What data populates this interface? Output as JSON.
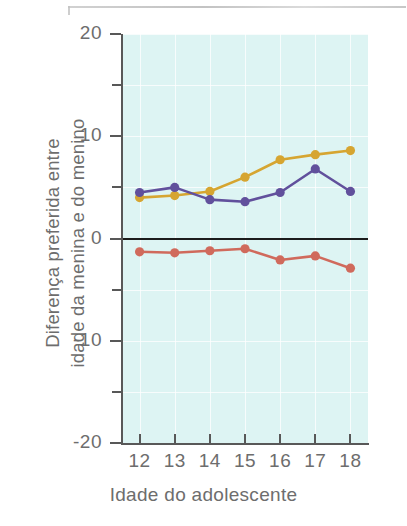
{
  "chart_data": {
    "type": "line",
    "title": "",
    "subtitle": "",
    "xlabel": "Idade do adolescente",
    "ylabel": "Diferença preferida entre idade da menina e do menino",
    "ylabel_line1": "Diferença preferida entre",
    "ylabel_line2": "idade da menina e do menino",
    "x": [
      12,
      13,
      14,
      15,
      16,
      17,
      18
    ],
    "categories": [
      "12",
      "13",
      "14",
      "15",
      "16",
      "17",
      "18"
    ],
    "xlim": [
      11.5,
      18.5
    ],
    "ylim": [
      -20,
      20
    ],
    "ytick_labels": [
      "20",
      "10",
      "0",
      "-10",
      "-20"
    ],
    "ytick_values": [
      20,
      10,
      0,
      -10,
      -20
    ],
    "yminor_values": [
      15,
      5,
      -5,
      -15
    ],
    "grid": true,
    "legend": "none",
    "plot_background": "#ddf4f3",
    "zero_line_color": "#1c1c1c",
    "series": [
      {
        "name": "serie-amarela",
        "color": "#d6a531",
        "marker": "circle",
        "values": [
          4.0,
          4.2,
          4.6,
          6.0,
          7.7,
          8.2,
          8.6
        ]
      },
      {
        "name": "serie-roxa",
        "color": "#61509c",
        "marker": "circle",
        "values": [
          4.5,
          5.0,
          3.8,
          3.6,
          4.5,
          6.8,
          4.6
        ]
      },
      {
        "name": "serie-vermelha",
        "color": "#d06a5c",
        "marker": "circle",
        "values": [
          -1.3,
          -1.4,
          -1.2,
          -1.0,
          -2.1,
          -1.7,
          -2.9
        ]
      }
    ]
  },
  "axes": {
    "y_tick_0": "20",
    "y_tick_1": "10",
    "y_tick_2": "0",
    "y_tick_3": "-10",
    "y_tick_4": "-20"
  }
}
